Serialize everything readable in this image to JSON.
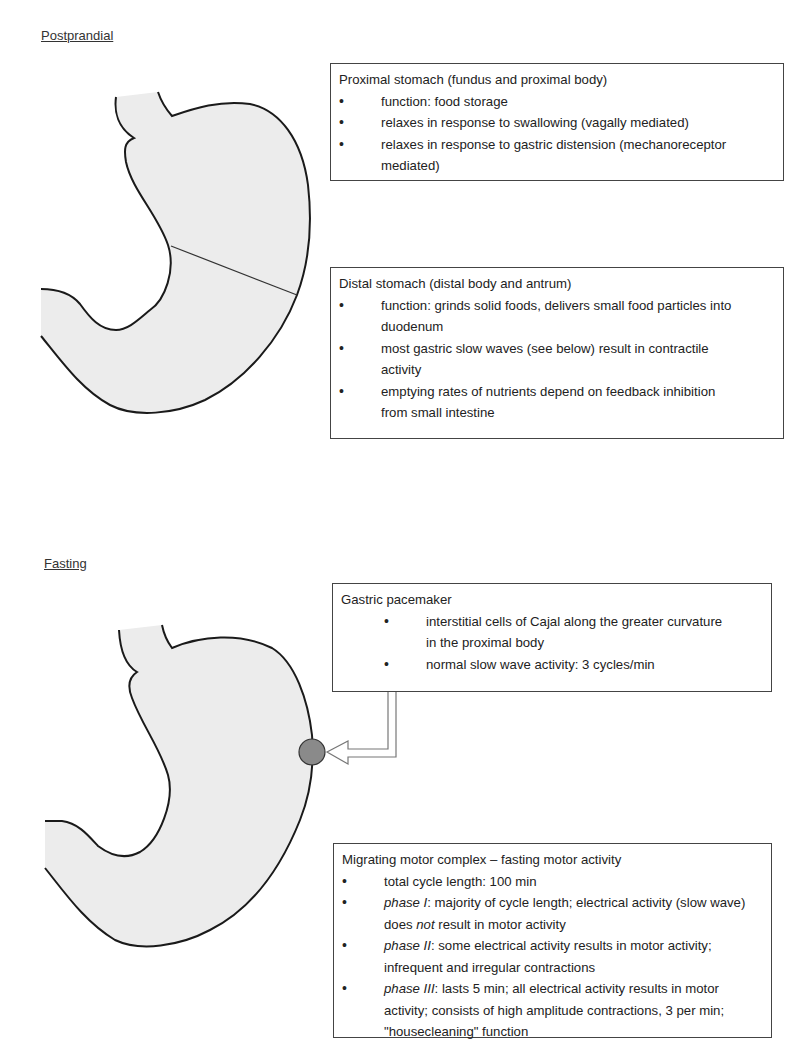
{
  "sections": {
    "postprandial": {
      "label": "Postprandial",
      "proximal_box": {
        "title": "Proximal stomach (fundus and proximal body)",
        "items": [
          "function: food storage",
          "relaxes in response to swallowing (vagally mediated)",
          "relaxes in response to gastric distension (mechanoreceptor mediated)"
        ]
      },
      "distal_box": {
        "title": "Distal stomach (distal body and antrum)",
        "items": [
          "function: grinds solid foods, delivers small food particles into duodenum",
          "most gastric slow waves (see below) result in contractile activity",
          "emptying rates of nutrients depend  on feedback inhibition from small intestine"
        ]
      }
    },
    "fasting": {
      "label": "Fasting",
      "pacemaker_box": {
        "title": "Gastric pacemaker",
        "items": [
          "interstitial cells of Cajal along the greater curvature in the proximal body",
          "normal slow wave activity: 3 cycles/min"
        ]
      },
      "mmc_box": {
        "title": "Migrating motor complex – fasting motor activity",
        "items": [
          {
            "em": "",
            "text": "total cycle length: 100 min"
          },
          {
            "em": "phase I",
            "text": ": majority of cycle length; electrical activity (slow wave) does ",
            "em2": "not",
            "text2": " result in motor activity"
          },
          {
            "em": "phase II",
            "text": ": some electrical activity results in motor activity; infrequent and irregular contractions"
          },
          {
            "em": "phase III",
            "text": ": lasts 5 min; all electrical activity results in motor activity; consists of high amplitude contractions, 3 per min; \"housecleaning\" function"
          }
        ]
      }
    }
  },
  "colors": {
    "stomach_fill": "#ececec",
    "outline": "#1a1a1a",
    "pacemaker_dot": "#8a8a8a"
  }
}
